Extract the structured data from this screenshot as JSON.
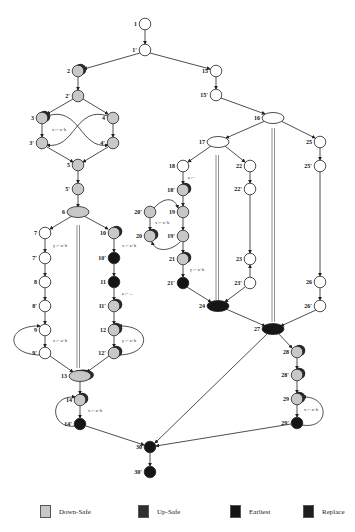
{
  "colors": {
    "down_safe": "#c8c8c8",
    "up_safe": "#2a2a2a",
    "earliest": "#151515",
    "replace": "#1e1e1e",
    "open": "#ffffff",
    "edge": "#222222"
  },
  "nodes": [
    {
      "id": "1",
      "x": 145,
      "y": 24,
      "fill": "open"
    },
    {
      "id": "1'",
      "x": 145,
      "y": 50,
      "fill": "open"
    },
    {
      "id": "2",
      "x": 78,
      "y": 71,
      "fill": "down",
      "mark": true
    },
    {
      "id": "2'",
      "x": 78,
      "y": 96,
      "fill": "down"
    },
    {
      "id": "3",
      "x": 42,
      "y": 118,
      "fill": "down",
      "mark": true
    },
    {
      "id": "3'",
      "x": 42,
      "y": 143,
      "fill": "down"
    },
    {
      "id": "4",
      "x": 113,
      "y": 118,
      "fill": "down"
    },
    {
      "id": "4'",
      "x": 113,
      "y": 143,
      "fill": "down"
    },
    {
      "id": "5",
      "x": 78,
      "y": 165,
      "fill": "down"
    },
    {
      "id": "5'",
      "x": 78,
      "y": 189,
      "fill": "down"
    },
    {
      "id": "6",
      "x": 78,
      "y": 212,
      "fill": "down",
      "shape": "ellipse"
    },
    {
      "id": "7",
      "x": 45,
      "y": 233,
      "fill": "open"
    },
    {
      "id": "7'",
      "x": 45,
      "y": 258,
      "fill": "open"
    },
    {
      "id": "8",
      "x": 45,
      "y": 282,
      "fill": "open"
    },
    {
      "id": "8'",
      "x": 45,
      "y": 306,
      "fill": "open"
    },
    {
      "id": "9",
      "x": 45,
      "y": 330,
      "fill": "open"
    },
    {
      "id": "9'",
      "x": 45,
      "y": 353,
      "fill": "open"
    },
    {
      "id": "10",
      "x": 114,
      "y": 233,
      "fill": "down",
      "mark": true
    },
    {
      "id": "10'",
      "x": 114,
      "y": 258,
      "fill": "dark"
    },
    {
      "id": "11",
      "x": 114,
      "y": 282,
      "fill": "dark"
    },
    {
      "id": "11'",
      "x": 114,
      "y": 306,
      "fill": "down",
      "mark": true
    },
    {
      "id": "12",
      "x": 114,
      "y": 330,
      "fill": "down",
      "mark": true
    },
    {
      "id": "12'",
      "x": 114,
      "y": 353,
      "fill": "down",
      "mark": true
    },
    {
      "id": "13",
      "x": 80,
      "y": 376,
      "fill": "down",
      "shape": "ellipse",
      "mark": true
    },
    {
      "id": "14",
      "x": 80,
      "y": 400,
      "fill": "down",
      "mark": true
    },
    {
      "id": "14'",
      "x": 80,
      "y": 424,
      "fill": "dark"
    },
    {
      "id": "15",
      "x": 216,
      "y": 71,
      "fill": "open"
    },
    {
      "id": "15'",
      "x": 216,
      "y": 95,
      "fill": "open"
    },
    {
      "id": "16",
      "x": 273,
      "y": 118,
      "fill": "open",
      "shape": "ellipse"
    },
    {
      "id": "17",
      "x": 218,
      "y": 142,
      "fill": "open",
      "shape": "ellipse"
    },
    {
      "id": "18",
      "x": 183,
      "y": 166,
      "fill": "open"
    },
    {
      "id": "18'",
      "x": 183,
      "y": 190,
      "fill": "down",
      "mark": true
    },
    {
      "id": "19",
      "x": 183,
      "y": 212,
      "fill": "down"
    },
    {
      "id": "19'",
      "x": 183,
      "y": 236,
      "fill": "down"
    },
    {
      "id": "20'",
      "x": 150,
      "y": 212,
      "fill": "down"
    },
    {
      "id": "20",
      "x": 150,
      "y": 236,
      "fill": "down",
      "mark": true
    },
    {
      "id": "21",
      "x": 183,
      "y": 259,
      "fill": "down",
      "mark": true
    },
    {
      "id": "21'",
      "x": 183,
      "y": 283,
      "fill": "dark"
    },
    {
      "id": "22",
      "x": 250,
      "y": 166,
      "fill": "open"
    },
    {
      "id": "22'",
      "x": 250,
      "y": 189,
      "fill": "open"
    },
    {
      "id": "23",
      "x": 250,
      "y": 259,
      "fill": "open"
    },
    {
      "id": "23'",
      "x": 250,
      "y": 283,
      "fill": "open"
    },
    {
      "id": "24",
      "x": 218,
      "y": 306,
      "fill": "dark",
      "shape": "ellipse"
    },
    {
      "id": "25",
      "x": 320,
      "y": 142,
      "fill": "open"
    },
    {
      "id": "25'",
      "x": 320,
      "y": 166,
      "fill": "open"
    },
    {
      "id": "26",
      "x": 320,
      "y": 282,
      "fill": "open"
    },
    {
      "id": "26'",
      "x": 320,
      "y": 306,
      "fill": "open"
    },
    {
      "id": "27",
      "x": 273,
      "y": 329,
      "fill": "dark",
      "shape": "ellipse"
    },
    {
      "id": "28",
      "x": 297,
      "y": 352,
      "fill": "down",
      "mark": true
    },
    {
      "id": "28'",
      "x": 297,
      "y": 375,
      "fill": "down",
      "mark": true
    },
    {
      "id": "29",
      "x": 297,
      "y": 399,
      "fill": "down",
      "mark": true
    },
    {
      "id": "29'",
      "x": 297,
      "y": 423,
      "fill": "dark"
    },
    {
      "id": "30",
      "x": 150,
      "y": 447,
      "fill": "dark"
    },
    {
      "id": "30'",
      "x": 150,
      "y": 472,
      "fill": "dark"
    }
  ],
  "annotations": [
    {
      "text": "x := a+b",
      "x": 52,
      "y": 131
    },
    {
      "text": "y := a+b",
      "x": 53,
      "y": 247
    },
    {
      "text": "x := a+b",
      "x": 53,
      "y": 342
    },
    {
      "text": "x := a+b",
      "x": 122,
      "y": 247
    },
    {
      "text": "a := ...",
      "x": 122,
      "y": 295
    },
    {
      "text": "y := a+b",
      "x": 122,
      "y": 342
    },
    {
      "text": "x := a+b",
      "x": 88,
      "y": 412
    },
    {
      "text": "a :=",
      "x": 188,
      "y": 179
    },
    {
      "text": "x := a+b",
      "x": 155,
      "y": 224
    },
    {
      "text": "y := a+b",
      "x": 190,
      "y": 271
    },
    {
      "text": "x := a+b",
      "x": 304,
      "y": 411
    }
  ],
  "legend": [
    {
      "label": "Down-Safe",
      "color": "#c8c8c8",
      "x": 40
    },
    {
      "label": "Up-Safe",
      "color": "#2e2e2e",
      "x": 138
    },
    {
      "label": "Earliest",
      "color": "#151515",
      "x": 230
    },
    {
      "label": "Replace",
      "color": "#1e1e1e",
      "x": 303
    }
  ]
}
